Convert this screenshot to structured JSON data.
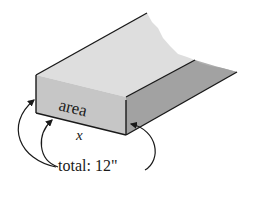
{
  "diagram": {
    "labels": {
      "area": "area",
      "x": "x",
      "total": "total: 12\""
    },
    "colors": {
      "top_surface": "#dcdcdc",
      "front_face": "#c4c4c4",
      "right_wall": "#9e9e9e",
      "edge": "#1a1a1a",
      "background": "#ffffff"
    }
  }
}
